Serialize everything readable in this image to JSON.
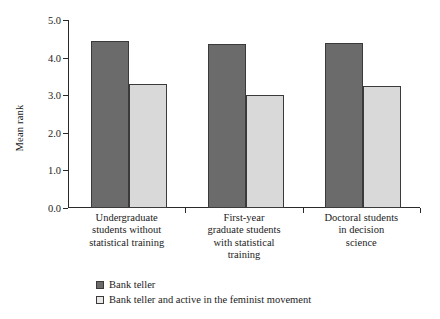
{
  "chart_data": {
    "type": "bar",
    "title": "",
    "xlabel": "",
    "ylabel": "Mean rank",
    "ylim": [
      0.0,
      5.0
    ],
    "ytick_step": 1.0,
    "ytick_labels": [
      "0.0",
      "1.0",
      "2.0",
      "3.0",
      "4.0",
      "5.0"
    ],
    "grid": false,
    "legend_position": "below-left",
    "categories": [
      "Undergraduate students without statistical training",
      "First-year graduate students with statistical training",
      "Doctoral students in decision science"
    ],
    "category_lines": [
      [
        "Undergraduate",
        "students without",
        "statistical training"
      ],
      [
        "First-year",
        "graduate students",
        "with statistical",
        "training"
      ],
      [
        "Doctoral students",
        "in decision",
        "science"
      ]
    ],
    "series": [
      {
        "name": "Bank teller",
        "color": "#6b6b6b",
        "values": [
          4.45,
          4.35,
          4.38
        ]
      },
      {
        "name": "Bank teller and active in the feminist movement",
        "color": "#d9d9d9",
        "values": [
          3.3,
          3.0,
          3.25
        ]
      }
    ]
  },
  "legend": {
    "items": [
      {
        "label": "Bank teller",
        "swatch": "dark"
      },
      {
        "label": "Bank teller and active in the feminist movement",
        "swatch": "light"
      }
    ]
  }
}
